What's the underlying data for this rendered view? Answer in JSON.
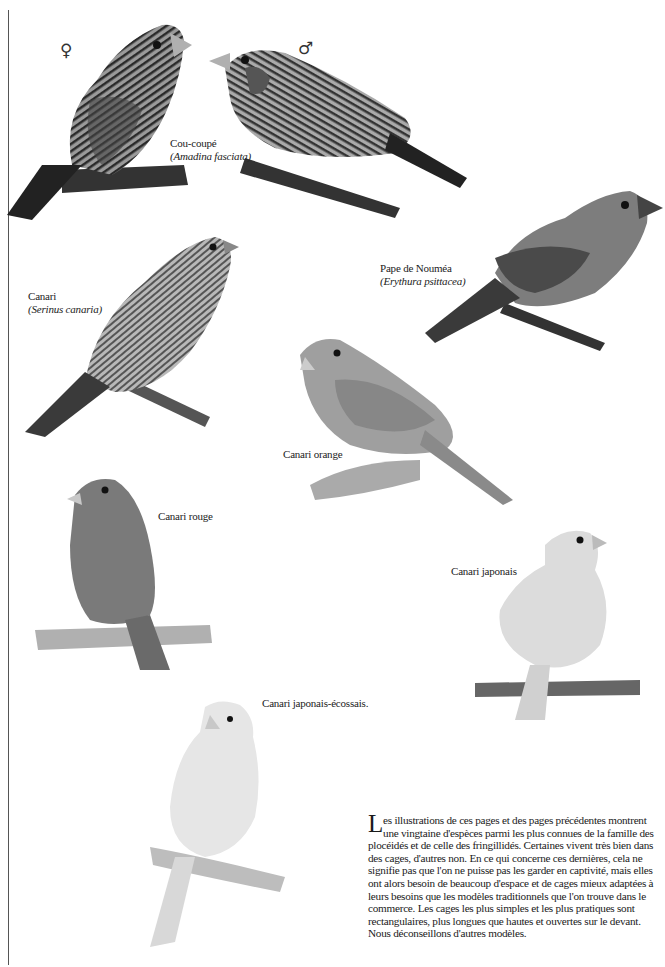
{
  "page": {
    "background": "#ffffff",
    "captions": [
      {
        "id": "cou-coupe",
        "common": "Cou-coupé",
        "latin": "(Amadina fasciata)"
      },
      {
        "id": "pape-noumea",
        "common": "Pape de Nouméa",
        "latin": "(Erythura psittacea)"
      },
      {
        "id": "canari",
        "common": "Canari",
        "latin": "(Serinus canaria)"
      },
      {
        "id": "canari-orange",
        "common": "Canari orange"
      },
      {
        "id": "canari-rouge",
        "common": "Canari rouge"
      },
      {
        "id": "canari-japonais",
        "common": "Canari japonais"
      },
      {
        "id": "canari-japonais-ecossais",
        "common": "Canari japonais-écossais."
      }
    ],
    "sex_symbols": {
      "female": "♀",
      "male": "♂"
    },
    "body_text": {
      "dropcap": "L",
      "text": "es illustrations de ces pages et des pages précédentes montrent une vingtaine d'espèces parmi les plus connues de la famille des plocéidés et de celle des fringillidés. Certaines vivent très bien dans des cages, d'autres non. En ce qui concerne ces dernières, cela ne signifie pas que l'on ne puisse pas les garder en captivité, mais elles ont alors besoin de beaucoup d'espace et de cages mieux adaptées à leurs besoins que les modèles traditionnels que l'on trouve dans le commerce. Les cages les plus simples et les plus pratiques sont rectangulaires, plus longues que hautes et ouvertes sur le devant. Nous déconseillons d'autres modèles."
    },
    "illustrations": [
      {
        "id": "cou-coupe-female",
        "name": "Cou-coupé femelle"
      },
      {
        "id": "cou-coupe-male",
        "name": "Cou-coupé mâle"
      },
      {
        "id": "pape-noumea",
        "name": "Pape de Nouméa"
      },
      {
        "id": "canari",
        "name": "Canari"
      },
      {
        "id": "canari-orange",
        "name": "Canari orange"
      },
      {
        "id": "canari-rouge",
        "name": "Canari rouge"
      },
      {
        "id": "canari-japonais",
        "name": "Canari japonais"
      },
      {
        "id": "canari-japonais-ecossais",
        "name": "Canari japonais-écossais"
      }
    ]
  }
}
